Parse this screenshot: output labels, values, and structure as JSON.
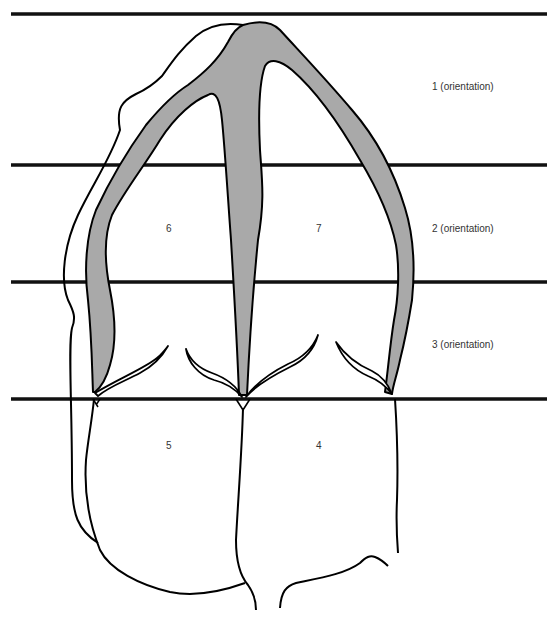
{
  "diagram": {
    "type": "anatomical schematic (cardiac segmentation view)",
    "colors": {
      "background": "#ffffff",
      "stroke": "#000000",
      "fill_shaded": "#a9a9a9",
      "label_text": "#333333"
    },
    "orientation_lines": [
      {
        "id": "top",
        "y": 14
      },
      {
        "id": "line-1",
        "y": 165
      },
      {
        "id": "line-2",
        "y": 282
      },
      {
        "id": "line-3",
        "y": 399
      }
    ],
    "orientation_labels": [
      {
        "text": "1 (orientation)",
        "x": 432,
        "y": 81
      },
      {
        "text": "2 (orientation)",
        "x": 432,
        "y": 223
      },
      {
        "text": "3 (orientation)",
        "x": 432,
        "y": 339
      }
    ],
    "segment_labels": [
      {
        "text": "6",
        "x": 166,
        "y": 223
      },
      {
        "text": "7",
        "x": 316,
        "y": 223
      },
      {
        "text": "5",
        "x": 166,
        "y": 440
      },
      {
        "text": "4",
        "x": 316,
        "y": 440
      }
    ]
  }
}
